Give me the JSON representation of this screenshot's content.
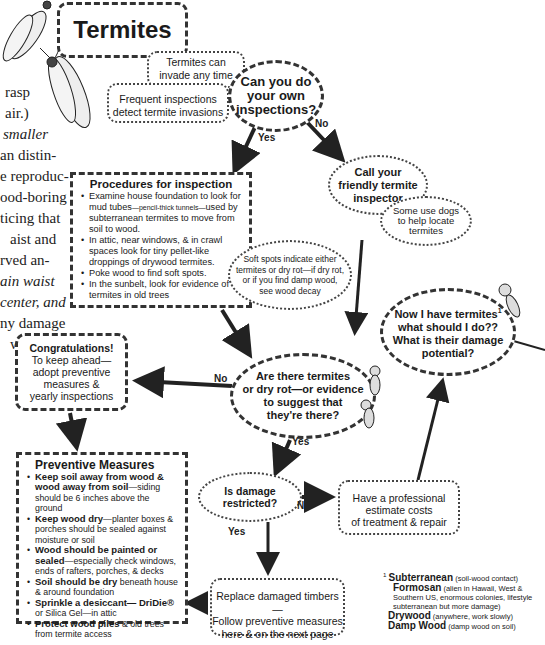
{
  "title": "Termites",
  "side_text_lines": [
    "rasp",
    "air.)",
    "smaller",
    "an distin-",
    "e reproduc-",
    "ood-boring",
    "ticing that",
    "aist and",
    "rved an-",
    "ain waist",
    "center, and",
    "ny damage",
    "will be su-"
  ],
  "side_text_lines_lower": [
    "l",
    "-",
    "l",
    "-",
    "-",
    "-",
    "-",
    "v",
    "e",
    "c",
    "l",
    "t",
    "-",
    "-",
    "-"
  ],
  "notes": {
    "invade": [
      "Termites can",
      "invade any time"
    ],
    "frequent": [
      "Frequent inspections",
      "detect termite invasions"
    ]
  },
  "question1": [
    "Can you do",
    "your own",
    "inspections?"
  ],
  "labels": {
    "yes1": "Yes",
    "no1": "No",
    "no2": "No",
    "yes2": "Yes",
    "no3": "No",
    "yes3": "Yes"
  },
  "inspector": [
    "Call your",
    "friendly termite",
    "inspector"
  ],
  "dogs": [
    "Some use dogs",
    "to help locate",
    "termites"
  ],
  "procedures": {
    "heading": "Procedures for inspection",
    "items": [
      {
        "pre": "Examine house foundation to look for mud tubes",
        "small": "—pencil-thick tunnels—",
        "post": "used by subterranean termites to move from soil to wood."
      },
      {
        "pre": "In attic, near windows, & in crawl spaces look for tiny pellet-like droppings of drywood termites.",
        "small": "",
        "post": ""
      },
      {
        "pre": "Poke wood to find soft spots.",
        "small": "",
        "post": ""
      },
      {
        "pre": "In the sunbelt, look for evidence of termites in old trees",
        "small": "",
        "post": ""
      }
    ]
  },
  "softspots": [
    "Soft spots indicate either",
    "termites or dry rot—if dry rot,",
    "or if you find damp wood,",
    "see wood decay"
  ],
  "now_what": [
    "Now I have termites",
    "what should I do??",
    "What is their damage",
    "potential?"
  ],
  "now_what_sup": "1",
  "congrats": {
    "heading": "Congratulations!",
    "lines": [
      "To keep ahead—",
      "adopt preventive",
      "measures &",
      "yearly inspections"
    ]
  },
  "question2": [
    "Are there termites",
    "or dry rot—or evidence",
    "to suggest that",
    "they're there?"
  ],
  "preventive": {
    "heading": "Preventive Measures",
    "items": [
      {
        "bold": "Keep soil away from wood & wood away from soil",
        "rest": "—siding should be 6 inches  above the ground"
      },
      {
        "bold": "Keep wood dry",
        "rest": "—planter boxes & porches should be sealed against moisture or soil"
      },
      {
        "bold": "Wood should be painted or sealed",
        "rest": "—especially check windows, ends of rafters, porches, & decks"
      },
      {
        "bold": "Soil should be dry",
        "rest": " beneath house & around foundation"
      },
      {
        "bold": "Sprinkle a desiccant— DriDie®",
        "rest": " or Silica Gel—in attic"
      },
      {
        "bold": "Protect wood piles",
        "rest": " & old trees from termite access"
      }
    ]
  },
  "question3": [
    "Is damage",
    "restricted?"
  ],
  "professional": [
    "Have a professional",
    "estimate costs",
    "of treatment & repair"
  ],
  "replace": [
    "Replace damaged timbers—",
    "Follow preventive measures",
    "here & on the next page"
  ],
  "footnote": {
    "marker": "1",
    "entries": [
      {
        "bold": "Subterranean",
        "rest": " (soil-wood contact)"
      },
      {
        "bold": "Formosan",
        "rest": " (alien in Hawaii, West & Southern US, enormous colonies, lifestyle subterranean but more damage)"
      },
      {
        "bold": "Drywood",
        "rest": " (anywhere, work slowly)"
      },
      {
        "bold": "Damp Wood",
        "rest": " (damp wood on soil)"
      }
    ]
  }
}
